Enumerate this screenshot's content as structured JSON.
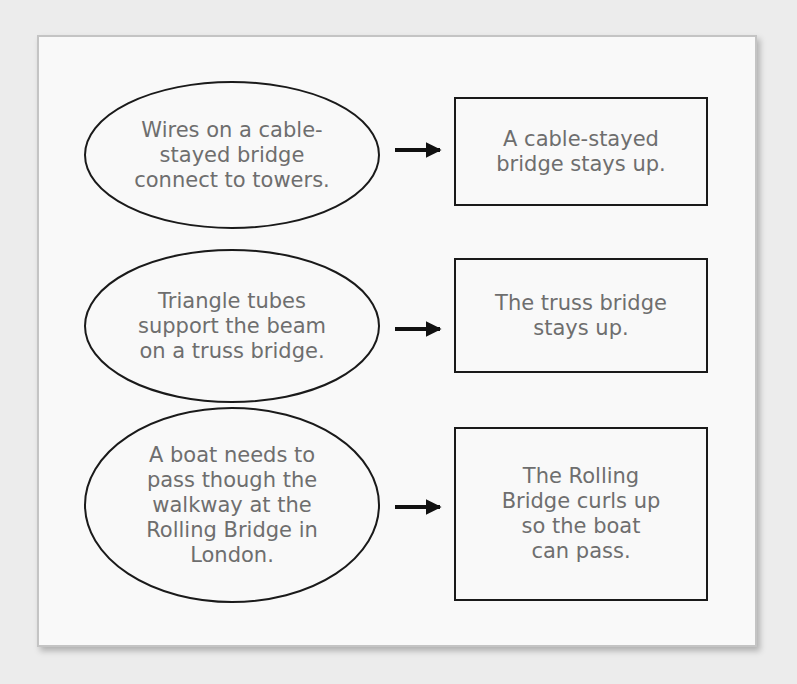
{
  "diagram": {
    "type": "cause-effect",
    "rows": [
      {
        "cause": "Wires on a cable-\nstayed bridge\nconnect to towers.",
        "effect": "A cable-stayed\nbridge stays up."
      },
      {
        "cause": "Triangle tubes\nsupport the beam\non a truss bridge.",
        "effect": "The truss bridge\nstays up."
      },
      {
        "cause": "A boat needs to\npass though the\nwalkway at the\nRolling Bridge in\nLondon.",
        "effect": "The Rolling\nBridge curls up\nso the boat\ncan pass."
      }
    ],
    "arrow_icon": "right-arrow-icon"
  }
}
